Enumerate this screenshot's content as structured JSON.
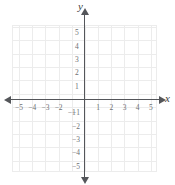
{
  "figure": {
    "type": "coordinate-plane",
    "axis_label_x": "x",
    "axis_label_y": "y",
    "colors": {
      "background": "#ffffff",
      "grid": "#ececec",
      "axis": "#54565a",
      "tick_label": "#6e7073",
      "axis_label": "#3b3d40"
    }
  },
  "chart_data": {
    "type": "scatter",
    "title": "",
    "xlabel": "x",
    "ylabel": "y",
    "xlim": [
      -5.5,
      5.5
    ],
    "ylim": [
      -5.5,
      5.5
    ],
    "grid": true,
    "legend": null,
    "series": [],
    "x_ticks": [
      {
        "value": -5,
        "label": "−5"
      },
      {
        "value": -4,
        "label": "−4"
      },
      {
        "value": -3,
        "label": "−3"
      },
      {
        "value": -2,
        "label": "−2"
      },
      {
        "value": -1,
        "label": "−1"
      },
      {
        "value": 1,
        "label": "1"
      },
      {
        "value": 2,
        "label": "2"
      },
      {
        "value": 3,
        "label": "3"
      },
      {
        "value": 4,
        "label": "4"
      },
      {
        "value": 5,
        "label": "5"
      }
    ],
    "y_ticks": [
      {
        "value": 5,
        "label": "5"
      },
      {
        "value": 4,
        "label": "4"
      },
      {
        "value": 3,
        "label": "3"
      },
      {
        "value": 2,
        "label": "2"
      },
      {
        "value": 1,
        "label": "1"
      },
      {
        "value": -1,
        "label": "−1"
      },
      {
        "value": -2,
        "label": "−2"
      },
      {
        "value": -3,
        "label": "−3"
      },
      {
        "value": -4,
        "label": "−4"
      },
      {
        "value": -5,
        "label": "−5"
      }
    ]
  }
}
